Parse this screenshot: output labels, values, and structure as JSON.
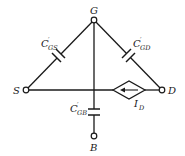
{
  "diagram": {
    "type": "circuit",
    "nodes": {
      "gate": {
        "label": "G"
      },
      "source": {
        "label": "S"
      },
      "drain": {
        "label": "D"
      },
      "body": {
        "label": "B"
      }
    },
    "capacitors": {
      "cgs": {
        "main": "C",
        "prime": "′",
        "sub": "GS"
      },
      "cgd": {
        "main": "C",
        "prime": "′",
        "sub": "GD"
      },
      "cgb": {
        "main": "C",
        "prime": "′",
        "sub": "GB"
      }
    },
    "current_source": {
      "main": "I",
      "sub": "D",
      "direction": "drain-to-source"
    },
    "colors": {
      "line": "#1a1a1a",
      "background": "#ffffff"
    }
  }
}
